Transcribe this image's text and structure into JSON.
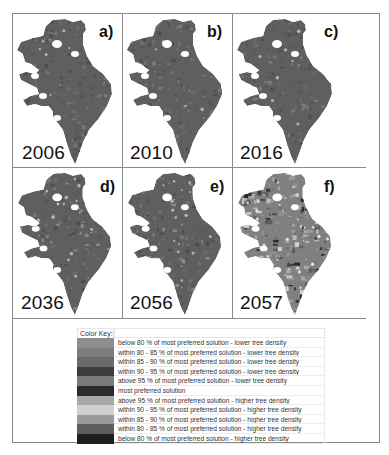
{
  "figure": {
    "panels": [
      {
        "letter": "a)",
        "year": "2006",
        "variant": "early"
      },
      {
        "letter": "b)",
        "year": "2010",
        "variant": "early"
      },
      {
        "letter": "c)",
        "year": "2016",
        "variant": "early"
      },
      {
        "letter": "d)",
        "year": "2036",
        "variant": "mid"
      },
      {
        "letter": "e)",
        "year": "2056",
        "variant": "mid"
      },
      {
        "letter": "f)",
        "year": "2057",
        "variant": "late"
      }
    ],
    "legend": {
      "title": "Color Key:",
      "items": [
        {
          "label": "below 80 % of most preferred solution - lower tree density",
          "color": "#8e8e8e"
        },
        {
          "label": "within 80 - 85 % of most preferred solution - lower tree density",
          "color": "#7d7d7d"
        },
        {
          "label": "within 85 - 90 % of most preferred solution - lower tree density",
          "color": "#6a6a6a"
        },
        {
          "label": "within 90 - 95 % of most preferred solution - lower tree density",
          "color": "#3c3c3c"
        },
        {
          "label": "above 95 % of most preferred solution - lower tree density",
          "color": "#7a7a7a"
        },
        {
          "label": "most preferred solution",
          "color": "#2c2c2c"
        },
        {
          "label": "above 95 % of most preferred solution - higher tree density",
          "color": "#a8a8a8"
        },
        {
          "label": "within 90 - 95 % of most preferred solution - higher tree density",
          "color": "#cfcfcf"
        },
        {
          "label": "within 85 - 90 % of most preferred solution - higher tree density",
          "color": "#9a9a9a"
        },
        {
          "label": "within 80 - 85 % of most preferred solution - higher tree density",
          "color": "#5e5e5e"
        },
        {
          "label": "below 80 % of most preferred solution - higher tree density",
          "color": "#1f1f1f"
        }
      ]
    }
  }
}
